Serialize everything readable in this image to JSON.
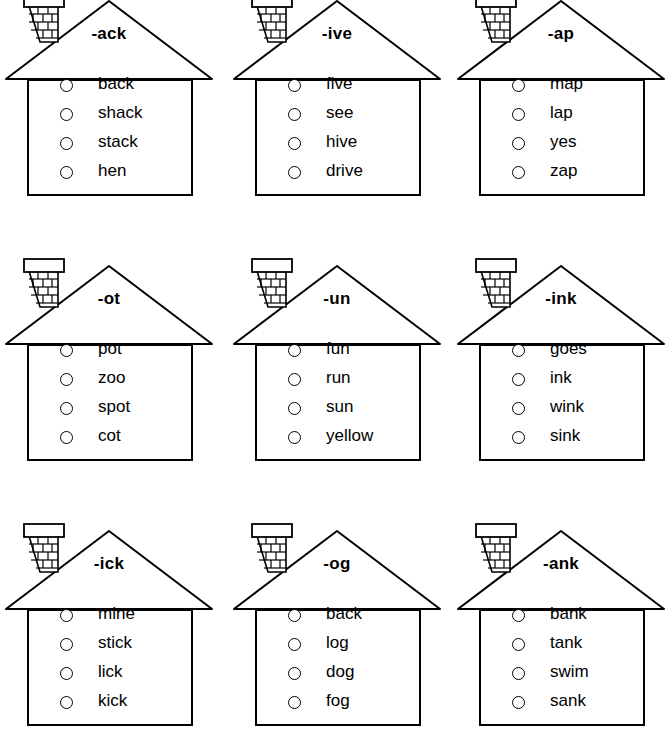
{
  "worksheet": {
    "title": "Word Family Houses Worksheet",
    "columns": 3,
    "rows": 3,
    "bubble_icon": "circle-bubble-icon",
    "house_icon": "house-outline-icon",
    "chimney_icon": "brick-chimney-icon"
  },
  "houses": [
    {
      "id": "house-ack",
      "rime": "-ack",
      "words": [
        "back",
        "shack",
        "stack",
        "hen"
      ]
    },
    {
      "id": "house-ive",
      "rime": "-ive",
      "words": [
        "five",
        "see",
        "hive",
        "drive"
      ]
    },
    {
      "id": "house-ap",
      "rime": "-ap",
      "words": [
        "map",
        "lap",
        "yes",
        "zap"
      ]
    },
    {
      "id": "house-ot",
      "rime": "-ot",
      "words": [
        "pot",
        "zoo",
        "spot",
        "cot"
      ]
    },
    {
      "id": "house-un",
      "rime": "-un",
      "words": [
        "fun",
        "run",
        "sun",
        "yellow"
      ]
    },
    {
      "id": "house-ink",
      "rime": "-ink",
      "words": [
        "goes",
        "ink",
        "wink",
        "sink"
      ]
    },
    {
      "id": "house-ick",
      "rime": "-ick",
      "words": [
        "mine",
        "stick",
        "lick",
        "kick"
      ]
    },
    {
      "id": "house-og",
      "rime": "-og",
      "words": [
        "back",
        "log",
        "dog",
        "fog"
      ]
    },
    {
      "id": "house-ank",
      "rime": "-ank",
      "words": [
        "bank",
        "tank",
        "swim",
        "sank"
      ]
    }
  ],
  "colors": {
    "ink": "#000000",
    "paper": "#ffffff"
  }
}
